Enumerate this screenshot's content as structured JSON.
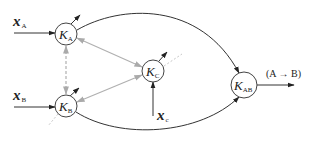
{
  "diagram": {
    "nodes": [
      {
        "id": "KA",
        "label": "K",
        "sub": "A",
        "cx": 66,
        "cy": 34,
        "r": 11
      },
      {
        "id": "KB",
        "label": "K",
        "sub": "B",
        "cx": 66,
        "cy": 106,
        "r": 11
      },
      {
        "id": "KC",
        "label": "K",
        "sub": "C",
        "cx": 153,
        "cy": 71,
        "r": 11
      },
      {
        "id": "KAB",
        "label": "K",
        "sub": "AB",
        "cx": 244,
        "cy": 85,
        "r": 13
      }
    ],
    "inputs": [
      {
        "id": "xA",
        "label": "x",
        "sub": "A",
        "target": "KA"
      },
      {
        "id": "xB",
        "label": "x",
        "sub": "B",
        "target": "KB"
      },
      {
        "id": "xc",
        "label": "x",
        "sub": "c",
        "target": "KC"
      }
    ],
    "output": {
      "label": "(A → B)",
      "source": "KAB"
    },
    "edges": [
      {
        "from": "KA",
        "to": "KAB",
        "style": "solid-curve"
      },
      {
        "from": "KB",
        "to": "KAB",
        "style": "solid-curve"
      },
      {
        "from": "KA",
        "to": "KC",
        "style": "gray-double-arrow"
      },
      {
        "from": "KB",
        "to": "KC",
        "style": "gray-double-arrow"
      },
      {
        "from": "KA",
        "to": "KB",
        "style": "gray-dashed-double-arrow"
      }
    ],
    "colors": {
      "line": "#333333",
      "gray": "#b0b0b0"
    }
  },
  "labels": {
    "xA": "x",
    "xA_sub": "A",
    "xB": "x",
    "xB_sub": "B",
    "xc": "x",
    "xc_sub": "c",
    "KA": "K",
    "KA_sub": "A",
    "KB": "K",
    "KB_sub": "B",
    "KC": "K",
    "KC_sub": "C",
    "KAB": "K",
    "KAB_sub": "AB",
    "out": "(A → B)"
  }
}
